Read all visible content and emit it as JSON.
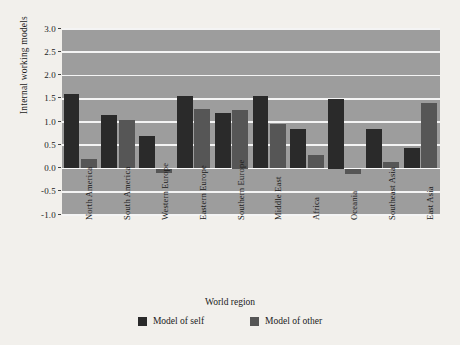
{
  "chart_data": {
    "type": "bar",
    "title": "",
    "xlabel": "World region",
    "ylabel": "Internal working models",
    "ylim": [
      -1.0,
      3.0
    ],
    "ytick_labels": [
      "3.0",
      "2.5",
      "2.0",
      "1.5",
      "1.0",
      "0.5",
      "0.0",
      "-0.5",
      "-1.0"
    ],
    "ytick_values": [
      3.0,
      2.5,
      2.0,
      1.5,
      1.0,
      0.5,
      0.0,
      -0.5,
      -1.0
    ],
    "grid": true,
    "legend_position": "bottom",
    "categories": [
      "North America",
      "South America",
      "Western Europe",
      "Eastern Europe",
      "Southern Europe",
      "Middle East",
      "Africa",
      "Oceania",
      "Southeast Asia",
      "East Asia"
    ],
    "series": [
      {
        "name": "Model of self",
        "color": "#2a2a2a",
        "values": [
          1.6,
          1.15,
          0.7,
          1.55,
          1.2,
          1.55,
          0.85,
          1.5,
          0.85,
          0.45
        ]
      },
      {
        "name": "Model of other",
        "color": "#565656",
        "values": [
          0.2,
          1.05,
          -0.1,
          1.28,
          1.25,
          0.95,
          0.3,
          -0.12,
          0.15,
          1.4
        ]
      }
    ]
  },
  "legend": {
    "items": [
      {
        "label": "Model of self"
      },
      {
        "label": "Model of other"
      }
    ]
  }
}
